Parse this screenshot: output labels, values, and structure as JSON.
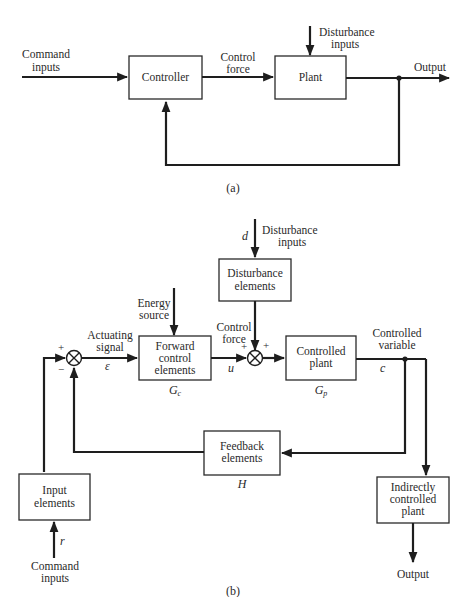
{
  "diagram_a": {
    "caption": "(a)",
    "command_inputs": [
      "Command",
      "inputs"
    ],
    "controller": "Controller",
    "control_force": [
      "Control",
      "force"
    ],
    "plant": "Plant",
    "disturbance_inputs": [
      "Disturbance",
      "inputs"
    ],
    "output": "Output"
  },
  "diagram_b": {
    "caption": "(b)",
    "disturbance_symbol": "d",
    "disturbance_inputs": [
      "Disturbance",
      "inputs"
    ],
    "disturbance_elements": [
      "Disturbance",
      "elements"
    ],
    "energy_source": [
      "Energy",
      "source"
    ],
    "actuating_signal": [
      "Actuating",
      "signal"
    ],
    "error_symbol": "ε",
    "forward_control": [
      "Forward",
      "control",
      "elements"
    ],
    "gc_symbol": "Gc",
    "control_force": [
      "Control",
      "force"
    ],
    "u_symbol": "u",
    "controlled_plant": [
      "Controlled",
      "plant"
    ],
    "gp_symbol": "Gp",
    "controlled_variable": [
      "Controlled",
      "variable"
    ],
    "c_symbol": "c",
    "feedback_elements": [
      "Feedback",
      "elements"
    ],
    "h_symbol": "H",
    "input_elements": [
      "Input",
      "elements"
    ],
    "r_symbol": "r",
    "command_inputs": [
      "Command",
      "inputs"
    ],
    "indirectly_controlled_plant": [
      "Indirectly",
      "controlled",
      "plant"
    ],
    "output": "Output",
    "sum1_signs": {
      "plus": "+",
      "minus": "−"
    },
    "sum2_signs": {
      "left": "+",
      "right": "+"
    }
  }
}
